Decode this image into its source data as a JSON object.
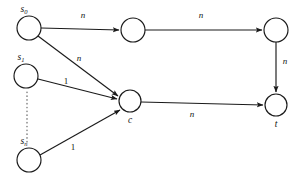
{
  "figure": {
    "type": "directed-graph",
    "background_color": "#ffffff",
    "stroke_color": "#1a1a1a",
    "dotted_color": "#555555"
  },
  "nodes": [
    {
      "id": "s0",
      "label_main": "s",
      "label_sub": "0",
      "cx": 29,
      "cy": 28,
      "r": 12,
      "label_x": 24,
      "label_y": 12
    },
    {
      "id": "s1",
      "label_main": "s",
      "label_sub": "1",
      "cx": 26,
      "cy": 76,
      "r": 12,
      "label_x": 21,
      "label_y": 60
    },
    {
      "id": "sn",
      "label_main": "s",
      "label_sub": "n",
      "cx": 29,
      "cy": 160,
      "r": 12,
      "label_x": 24,
      "label_y": 144
    },
    {
      "id": "v1",
      "label_main": "",
      "label_sub": "",
      "cx": 133,
      "cy": 30,
      "r": 12,
      "label_x": 133,
      "label_y": 30
    },
    {
      "id": "v2",
      "label_main": "",
      "label_sub": "",
      "cx": 276,
      "cy": 30,
      "r": 12,
      "label_x": 276,
      "label_y": 30
    },
    {
      "id": "c",
      "label_main": "c",
      "label_sub": "",
      "cx": 130,
      "cy": 101,
      "r": 11,
      "label_x": 130,
      "label_y": 123
    },
    {
      "id": "t",
      "label_main": "t",
      "label_sub": "",
      "cx": 276,
      "cy": 105,
      "r": 11,
      "label_x": 276,
      "label_y": 127
    }
  ],
  "edges": [
    {
      "id": "e-s0-v1",
      "from": "s0",
      "to": "v1",
      "label": "n",
      "label_x": 83,
      "label_y": 18,
      "numeric": false
    },
    {
      "id": "e-v1-v2",
      "from": "v1",
      "to": "v2",
      "label": "n",
      "label_x": 201,
      "label_y": 18,
      "numeric": false
    },
    {
      "id": "e-v2-t",
      "from": "v2",
      "to": "t",
      "label": "n",
      "label_x": 285,
      "label_y": 64,
      "numeric": false
    },
    {
      "id": "e-s0-c",
      "from": "s0",
      "to": "c",
      "label": "n",
      "label_x": 79,
      "label_y": 61,
      "numeric": false
    },
    {
      "id": "e-s1-c",
      "from": "s1",
      "to": "c",
      "label": "1",
      "label_x": 66,
      "label_y": 84,
      "numeric": true
    },
    {
      "id": "e-sn-c",
      "from": "sn",
      "to": "c",
      "label": "1",
      "label_x": 73,
      "label_y": 150,
      "numeric": true
    },
    {
      "id": "e-c-t",
      "from": "c",
      "to": "t",
      "label": "n",
      "label_x": 192,
      "label_y": 117,
      "numeric": false
    }
  ],
  "ellipsis": {
    "id": "vertical-ellipsis",
    "x": 27,
    "y_start": 92,
    "y_end": 142
  }
}
